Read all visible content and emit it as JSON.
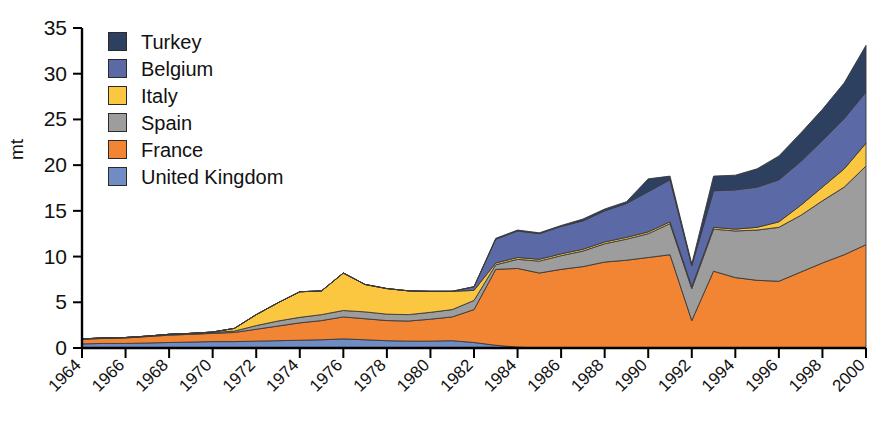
{
  "chart_data": {
    "type": "area",
    "stacked": true,
    "title": "",
    "xlabel": "",
    "ylabel": "mt",
    "ylim": [
      0,
      35
    ],
    "yticks": [
      0,
      5,
      10,
      15,
      20,
      25,
      30,
      35
    ],
    "grid": false,
    "legend_position": "top-left",
    "x": [
      1964,
      1965,
      1966,
      1967,
      1968,
      1969,
      1970,
      1971,
      1972,
      1973,
      1974,
      1975,
      1976,
      1977,
      1978,
      1979,
      1980,
      1981,
      1982,
      1983,
      1984,
      1985,
      1986,
      1987,
      1988,
      1989,
      1990,
      1991,
      1992,
      1993,
      1994,
      1995,
      1996,
      1997,
      1998,
      1999,
      2000
    ],
    "xticks": [
      1964,
      1966,
      1968,
      1970,
      1972,
      1974,
      1976,
      1978,
      1980,
      1982,
      1984,
      1986,
      1988,
      1990,
      1992,
      1994,
      1996,
      1998,
      2000
    ],
    "xtick_labels": [
      "1964",
      "1966",
      "1968",
      "1970",
      "1972",
      "1974",
      "1976",
      "1978",
      "1980",
      "1982",
      "1984",
      "1986",
      "1988",
      "1990",
      "1992",
      "1994",
      "1996",
      "1998",
      "2000"
    ],
    "series": [
      {
        "name": "United Kingdom",
        "color": "#6f8cc4",
        "values": [
          0.45,
          0.5,
          0.5,
          0.55,
          0.6,
          0.65,
          0.7,
          0.7,
          0.75,
          0.8,
          0.85,
          0.9,
          1.0,
          0.9,
          0.8,
          0.75,
          0.75,
          0.8,
          0.6,
          0.3,
          0.1,
          0.0,
          0.0,
          0.0,
          0.0,
          0.0,
          0.0,
          0.0,
          0.0,
          0.0,
          0.0,
          0.0,
          0.0,
          0.0,
          0.0,
          0.0,
          0.0
        ]
      },
      {
        "name": "France",
        "color": "#f28534",
        "values": [
          0.5,
          0.55,
          0.6,
          0.7,
          0.8,
          0.85,
          0.9,
          1.0,
          1.3,
          1.6,
          1.9,
          2.1,
          2.4,
          2.3,
          2.2,
          2.2,
          2.4,
          2.6,
          3.6,
          8.3,
          8.6,
          8.2,
          8.6,
          8.9,
          9.4,
          9.6,
          9.9,
          10.2,
          3.0,
          8.4,
          7.7,
          7.4,
          7.3,
          8.3,
          9.3,
          10.2,
          11.3
        ]
      },
      {
        "name": "Spain",
        "color": "#9d9d9d",
        "values": [
          0.05,
          0.05,
          0.05,
          0.05,
          0.1,
          0.1,
          0.1,
          0.15,
          0.4,
          0.55,
          0.6,
          0.65,
          0.7,
          0.75,
          0.7,
          0.7,
          0.75,
          0.8,
          1.0,
          0.5,
          1.0,
          1.3,
          1.5,
          1.7,
          2.0,
          2.3,
          2.6,
          3.4,
          3.5,
          4.6,
          5.1,
          5.5,
          5.9,
          6.2,
          6.8,
          7.4,
          8.6
        ]
      },
      {
        "name": "Italy",
        "color": "#fbc640",
        "values": [
          0.0,
          0.0,
          0.0,
          0.0,
          0.0,
          0.0,
          0.05,
          0.3,
          1.2,
          2.0,
          2.8,
          2.6,
          4.1,
          3.0,
          2.8,
          2.6,
          2.3,
          2.0,
          1.1,
          0.2,
          0.2,
          0.2,
          0.2,
          0.2,
          0.2,
          0.2,
          0.2,
          0.2,
          0.2,
          0.2,
          0.2,
          0.3,
          0.6,
          1.1,
          1.5,
          2.0,
          2.5
        ]
      },
      {
        "name": "Belgium",
        "color": "#5b69a6",
        "values": [
          0.0,
          0.0,
          0.0,
          0.0,
          0.0,
          0.0,
          0.0,
          0.0,
          0.0,
          0.0,
          0.0,
          0.0,
          0.0,
          0.0,
          0.0,
          0.0,
          0.0,
          0.0,
          0.4,
          2.6,
          2.9,
          2.8,
          3.0,
          3.1,
          3.4,
          3.7,
          4.4,
          4.6,
          2.3,
          4.0,
          4.3,
          4.4,
          4.6,
          4.8,
          5.1,
          5.5,
          5.6
        ]
      },
      {
        "name": "Turkey",
        "color": "#2e4060",
        "values": [
          0.0,
          0.0,
          0.0,
          0.0,
          0.0,
          0.0,
          0.0,
          0.0,
          0.0,
          0.0,
          0.0,
          0.0,
          0.0,
          0.0,
          0.0,
          0.0,
          0.0,
          0.0,
          0.0,
          0.1,
          0.1,
          0.1,
          0.1,
          0.2,
          0.2,
          0.2,
          1.4,
          0.4,
          0.2,
          1.6,
          1.6,
          2.0,
          2.6,
          3.1,
          3.4,
          3.9,
          5.1
        ]
      }
    ]
  },
  "legend": {
    "items": [
      {
        "label": "Turkey",
        "color": "#2e4060"
      },
      {
        "label": "Belgium",
        "color": "#5b69a6"
      },
      {
        "label": "Italy",
        "color": "#fbc640"
      },
      {
        "label": "Spain",
        "color": "#9d9d9d"
      },
      {
        "label": "France",
        "color": "#f28534"
      },
      {
        "label": "United Kingdom",
        "color": "#6f8cc4"
      }
    ]
  },
  "axes": {
    "y_title": "mt"
  }
}
